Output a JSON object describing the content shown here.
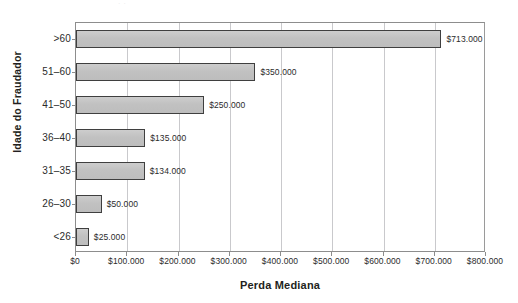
{
  "scan_artifact": "· ·",
  "chart_data": {
    "type": "bar",
    "orientation": "horizontal",
    "title": "",
    "xlabel": "Perda Mediana",
    "ylabel": "Idade do Fraudador",
    "categories": [
      ">60",
      "51–60",
      "41–50",
      "36–40",
      "31–35",
      "26–30",
      "<26"
    ],
    "values": [
      713000,
      350000,
      250000,
      135000,
      134000,
      50000,
      25000
    ],
    "value_labels": [
      "$713.000",
      "$350.000",
      "$250.000",
      "$135.000",
      "$134.000",
      "$50.000",
      "$25.000"
    ],
    "xlim": [
      0,
      800000
    ],
    "xticks": [
      0,
      100000,
      200000,
      300000,
      400000,
      500000,
      600000,
      700000,
      800000
    ],
    "xticklabels": [
      "$0",
      "$100.000",
      "$200.000",
      "$300.000",
      "$400.000",
      "$500.000",
      "$600.000",
      "$700.000",
      "$800.000"
    ],
    "grid": "vertical",
    "legend": null,
    "bar_fill_color": "#c3c3c3",
    "bar_edge_color": "#3f3f3f",
    "axis_color": "#8d8d8d",
    "gridline_color": "#c9c9cc",
    "text_color": "#231f20"
  }
}
